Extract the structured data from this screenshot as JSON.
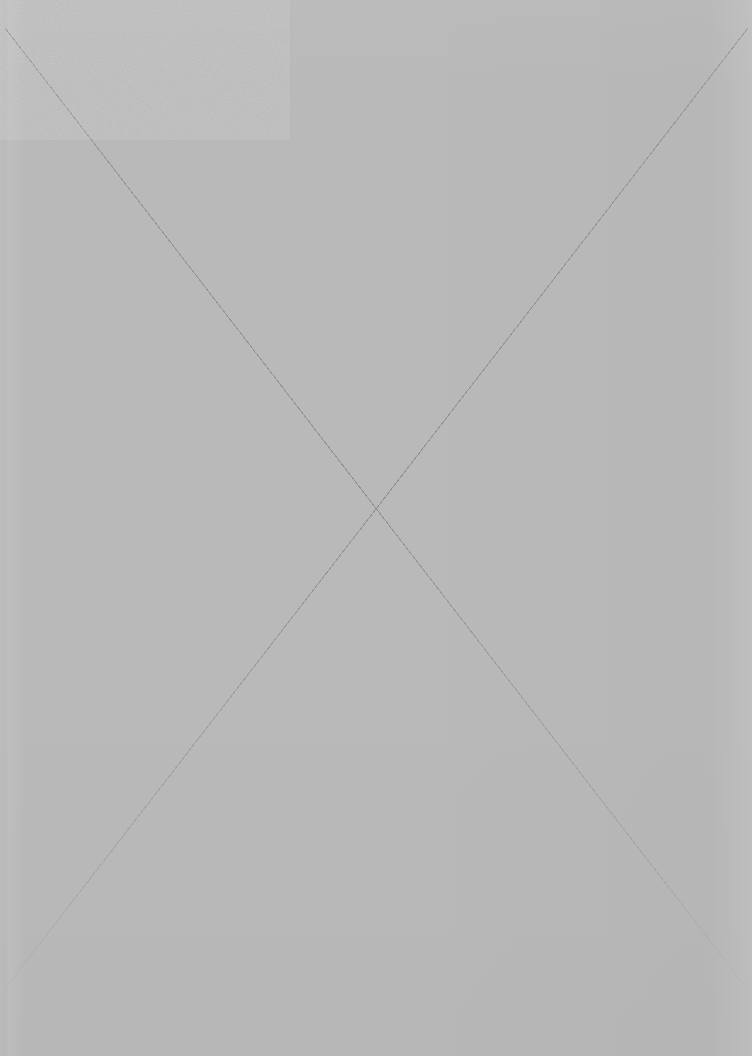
{
  "page": {
    "kind": "blank-page-placeholder",
    "width": 752,
    "height": 1056,
    "visible_text": "",
    "note": ""
  },
  "colors": {
    "background": "#b9b9b9",
    "line": "#8e8e8e",
    "edge_highlight": "#c6c6c6"
  },
  "placeholder": {
    "icon": "cross-out-x-icon",
    "label": ""
  },
  "cross_lines": [
    {
      "name": "diagonal-top-left-to-bottom-right",
      "x1": 5,
      "y1": 28,
      "x2": 748,
      "y2": 990
    },
    {
      "name": "diagonal-top-right-to-bottom-left",
      "x1": 748,
      "y1": 28,
      "x2": 4,
      "y2": 990
    }
  ],
  "crossing_point": {
    "x": 352,
    "y": 527
  }
}
